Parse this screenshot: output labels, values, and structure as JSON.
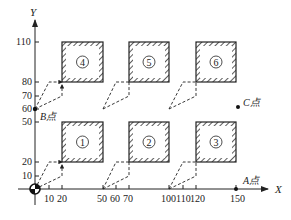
{
  "diagram": {
    "axes": {
      "x_label": "X",
      "y_label": "Y",
      "x_ticks": [
        {
          "value": 10,
          "label": "10"
        },
        {
          "value": 20,
          "label": "20"
        },
        {
          "value": 50,
          "label": "50"
        },
        {
          "value": 60,
          "label": "60"
        },
        {
          "value": 70,
          "label": "70"
        },
        {
          "value": 100,
          "label": "100"
        },
        {
          "value": 110,
          "label": "110"
        },
        {
          "value": 120,
          "label": "120"
        },
        {
          "value": 150,
          "label": "150"
        }
      ],
      "y_ticks": [
        {
          "value": 10,
          "label": "10"
        },
        {
          "value": 20,
          "label": "20"
        },
        {
          "value": 50,
          "label": "50"
        },
        {
          "value": 60,
          "label": "60"
        },
        {
          "value": 70,
          "label": "70"
        },
        {
          "value": 80,
          "label": "80"
        },
        {
          "value": 110,
          "label": "110"
        }
      ]
    },
    "boxes": [
      {
        "id": "1",
        "label": "①",
        "x0": 20,
        "y0": 20,
        "x1": 50,
        "y1": 50
      },
      {
        "id": "2",
        "label": "②",
        "x0": 70,
        "y0": 20,
        "x1": 100,
        "y1": 50
      },
      {
        "id": "3",
        "label": "③",
        "x0": 120,
        "y0": 20,
        "x1": 150,
        "y1": 50
      },
      {
        "id": "4",
        "label": "④",
        "x0": 20,
        "y0": 80,
        "x1": 50,
        "y1": 110
      },
      {
        "id": "5",
        "label": "⑤",
        "x0": 70,
        "y0": 80,
        "x1": 100,
        "y1": 110
      },
      {
        "id": "6",
        "label": "⑥",
        "x0": 120,
        "y0": 80,
        "x1": 150,
        "y1": 110
      }
    ],
    "points": [
      {
        "id": "A",
        "label": "A点",
        "x": 150,
        "y": 0
      },
      {
        "id": "B",
        "label": "B点",
        "x": 0,
        "y": 60
      },
      {
        "id": "C",
        "label": "C点",
        "x": 150,
        "y": 60
      }
    ],
    "colors": {
      "line": "#222222",
      "hatch": "#333333",
      "background": "#ffffff"
    }
  }
}
